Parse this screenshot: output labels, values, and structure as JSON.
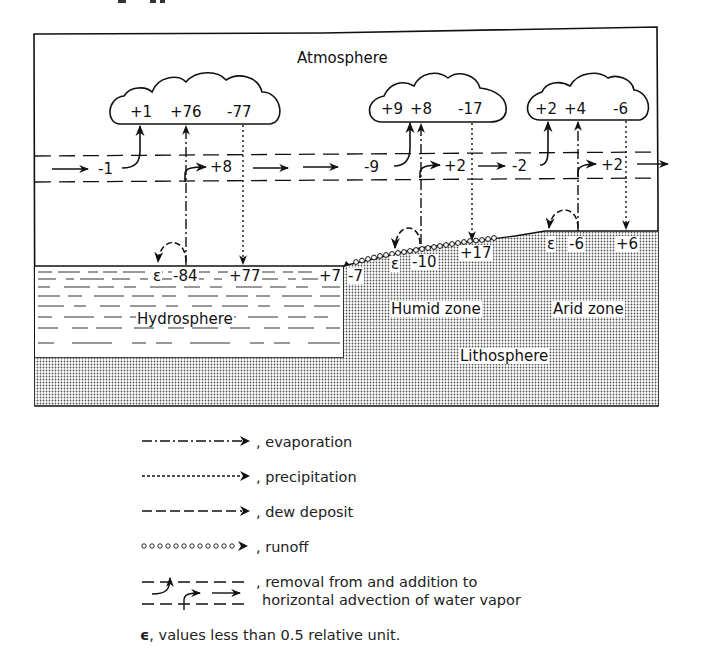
{
  "diagram": {
    "regions": {
      "atmosphere": "Atmosphere",
      "hydrosphere": "Hydrosphere",
      "lithosphere": "Lithosphere",
      "humid_zone": "Humid zone",
      "arid_zone": "Arid zone"
    },
    "clouds": [
      {
        "name": "ocean-cloud",
        "values": [
          "+1",
          "+76",
          "-77"
        ]
      },
      {
        "name": "humid-cloud",
        "values": [
          "+9",
          "+8",
          "-17"
        ]
      },
      {
        "name": "arid-cloud",
        "values": [
          "+2",
          "+4",
          "-6"
        ]
      }
    ],
    "advection": {
      "ocean_removal": "-1",
      "ocean_addition": "+8",
      "humid_removal": "-9",
      "humid_addition": "+2",
      "arid_removal": "-2",
      "arid_addition": "+2"
    },
    "surface": {
      "ocean_dew": "ε",
      "ocean_evaporation": "-84",
      "ocean_precipitation": "+77",
      "ocean_runoff_in": "+7",
      "humid_runoff_out": "-7",
      "humid_dew": "ε",
      "humid_evaporation": "-10",
      "humid_precipitation": "+17",
      "arid_dew": "ε",
      "arid_evaporation": "-6",
      "arid_precipitation": "+6"
    }
  },
  "legend": {
    "evaporation": ", evaporation",
    "precipitation": ", precipitation",
    "dew_deposit": ", dew deposit",
    "runoff": ", runoff",
    "advection_line1": ", removal from and addition to",
    "advection_line2": "horizontal advection of water vapor",
    "epsilon_symbol": "ϵ",
    "epsilon_note": ", values less than 0.5 relative unit."
  }
}
